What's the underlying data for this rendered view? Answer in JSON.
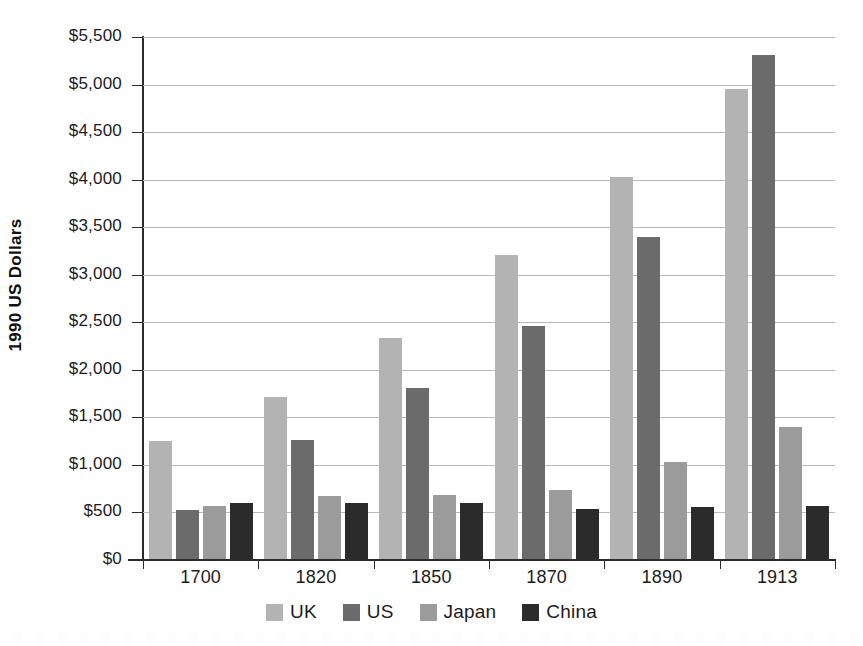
{
  "chart_data": {
    "type": "bar",
    "title": "",
    "subtitle": "",
    "xlabel": "",
    "ylabel": "1990 US Dollars",
    "categories": [
      "1700",
      "1820",
      "1850",
      "1870",
      "1890",
      "1913"
    ],
    "series": [
      {
        "name": "UK",
        "color": "#b3b3b3",
        "values": [
          1250,
          1710,
          2330,
          3210,
          4030,
          4950
        ]
      },
      {
        "name": "US",
        "color": "#6b6b6b",
        "values": [
          530,
          1260,
          1810,
          2460,
          3400,
          5310
        ]
      },
      {
        "name": "Japan",
        "color": "#9b9b9b",
        "values": [
          570,
          670,
          680,
          740,
          1030,
          1400
        ]
      },
      {
        "name": "China",
        "color": "#2b2b2b",
        "values": [
          600,
          600,
          600,
          540,
          555,
          570
        ]
      }
    ],
    "ylim": [
      0,
      5500
    ],
    "ytick_step": 500,
    "ytick_labels": [
      "$5,500",
      "$5,000",
      "$4,500",
      "$4,000",
      "$3,500",
      "$3,000",
      "$2,500",
      "$2,000",
      "$1,500",
      "$1,000",
      "$500",
      "$0"
    ],
    "ytick_values": [
      5500,
      5000,
      4500,
      4000,
      3500,
      3000,
      2500,
      2000,
      1500,
      1000,
      500,
      0
    ],
    "grid": true,
    "grid_axis": "y",
    "legend_position": "bottom",
    "legend_entries": [
      "UK",
      "US",
      "Japan",
      "China"
    ],
    "value_prefix": "$",
    "background_color": "#ffffff",
    "gridline_color": "#b9b9b9",
    "axis_color": "#2b2b2b"
  }
}
